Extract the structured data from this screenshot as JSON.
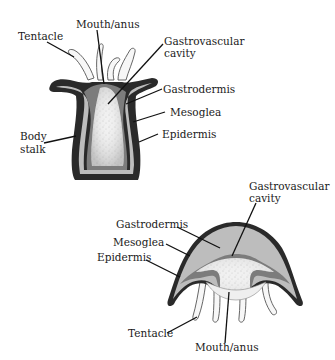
{
  "diagram": {
    "type": "anatomical-comparison",
    "colors": {
      "epidermis": "#2a2a2a",
      "mesoglea": "#bdbdbd",
      "gastrodermis": "#7c7c7c",
      "cavity": "#efefef",
      "tentacle_fill": "#f7f7f7",
      "label_text": "#1a1a1a"
    },
    "polyp": {
      "labels": {
        "tentacle": "Tentacle",
        "mouth_anus": "Mouth/anus",
        "cavity_line1": "Gastrovascular",
        "cavity_line2": "cavity",
        "gastrodermis": "Gastrodermis",
        "mesoglea": "Mesoglea",
        "epidermis": "Epidermis",
        "body_stalk_line1": "Body",
        "body_stalk_line2": "stalk"
      }
    },
    "medusa": {
      "labels": {
        "cavity_line1": "Gastrovascular",
        "cavity_line2": "cavity",
        "gastrodermis": "Gastrodermis",
        "mesoglea": "Mesoglea",
        "epidermis": "Epidermis",
        "tentacle": "Tentacle",
        "mouth_anus": "Mouth/anus"
      }
    }
  }
}
